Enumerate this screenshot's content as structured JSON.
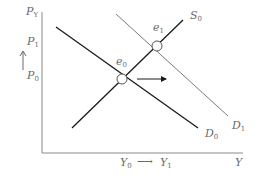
{
  "diagram": {
    "type": "supply-demand",
    "y_axis": {
      "labels": [
        {
          "id": "py",
          "base": "P",
          "sub": "Y"
        },
        {
          "id": "p1",
          "base": "P",
          "sub": "1"
        },
        {
          "id": "p0",
          "base": "P",
          "sub": "0"
        }
      ],
      "arrow": "↑"
    },
    "x_axis": {
      "y0": {
        "base": "Y",
        "sub": "0"
      },
      "arrow": "⟶",
      "y1": {
        "base": "Y",
        "sub": "1"
      },
      "title": "Y"
    },
    "curves": {
      "s0": {
        "base": "S",
        "sub": "0"
      },
      "d0": {
        "base": "D",
        "sub": "0"
      },
      "d1": {
        "base": "D",
        "sub": "1"
      }
    },
    "points": {
      "e0": {
        "base": "e",
        "sub": "0"
      },
      "e1": {
        "base": "e",
        "sub": "1"
      }
    },
    "colors": {
      "axis": "#8a8a8a",
      "d0": "#1a1a1a",
      "s0": "#1a1a1a",
      "d1": "#7a7a7a",
      "label": "#6a6a6a"
    }
  }
}
